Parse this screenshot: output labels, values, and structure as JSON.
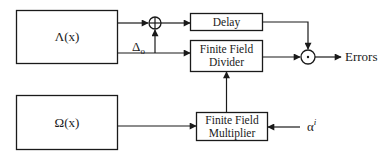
{
  "diagram": {
    "blocks": {
      "lambda": {
        "label": "Λ(x)"
      },
      "omega": {
        "label": "Ω(x)"
      },
      "delay": {
        "label": "Delay"
      },
      "divider": {
        "line1": "Finite Field",
        "line2": "Divider"
      },
      "multiplier": {
        "line1": "Finite Field",
        "line2": "Multiplier"
      }
    },
    "signals": {
      "delta": {
        "base": "Δ",
        "subscript": "o"
      },
      "alpha": {
        "base": "α",
        "superscript": "i"
      },
      "output": "Errors"
    },
    "operators": {
      "adder": "xor-adder",
      "multiplier_node": "dot-multiplier"
    }
  }
}
